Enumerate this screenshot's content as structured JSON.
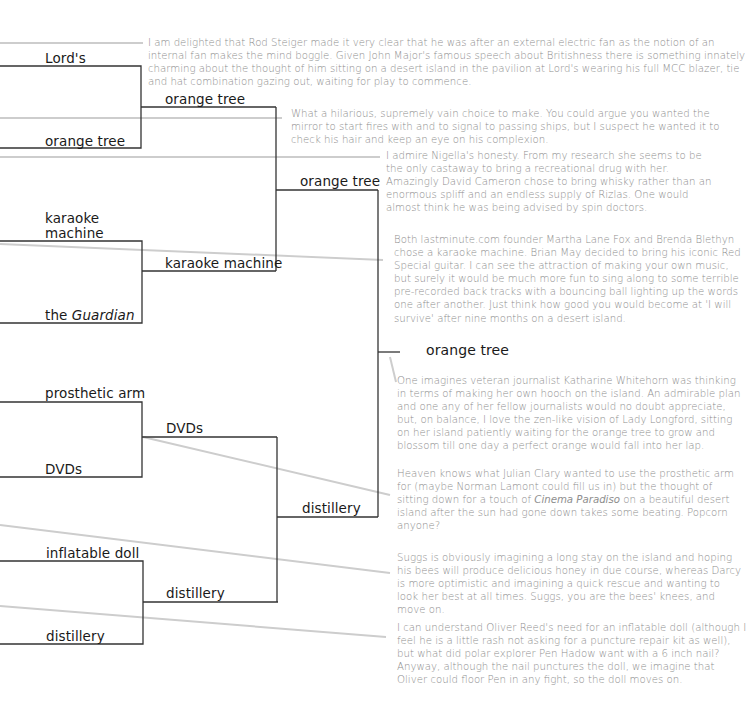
{
  "colors": {
    "bracket_line": "#333333",
    "connector_line": "#cccccc",
    "label_text": "#1a1a1a",
    "comment_text": "#8e8e8e",
    "background": "#ffffff"
  },
  "bracket": {
    "round1": [
      {
        "id": "lords",
        "label": "Lord's"
      },
      {
        "id": "orange-tree",
        "label": "orange tree"
      },
      {
        "id": "karaoke-machine",
        "label_line1": "karaoke",
        "label_line2": "machine"
      },
      {
        "id": "guardian",
        "label_prefix": "the ",
        "label_italic": "Guardian"
      },
      {
        "id": "prosthetic-arm",
        "label": "prosthetic arm"
      },
      {
        "id": "dvds",
        "label": "DVDs"
      },
      {
        "id": "inflatable-doll",
        "label": "inflatable doll"
      },
      {
        "id": "distillery",
        "label": "distillery"
      }
    ],
    "round2": [
      {
        "id": "r2-orange-tree",
        "label": "orange tree"
      },
      {
        "id": "r2-karaoke-machine",
        "label": "karaoke machine"
      },
      {
        "id": "r2-dvds",
        "label": "DVDs"
      },
      {
        "id": "r2-distillery",
        "label": "distillery"
      }
    ],
    "semifinal": [
      {
        "id": "sf-orange-tree",
        "label": "orange tree"
      },
      {
        "id": "sf-distillery",
        "label": "distillery"
      }
    ],
    "winner": {
      "label": "orange tree"
    }
  },
  "comments": [
    {
      "id": "rod-steiger",
      "text": "I am delighted that Rod Steiger made it very clear that he was after an external electric fan as the notion of an internal fan makes the mind boggle. Given John Major's famous speech about Britishness there is something innately charming about the thought of him sitting on a desert island in the pavilion at Lord's wearing his full MCC blazer, tie and hat combination gazing out, waiting for play to commence."
    },
    {
      "id": "vain-choice",
      "text": "What a hilarious, supremely vain choice to make. You could argue you wanted the mirror to start fires with and to signal to passing ships, but I suspect he wanted it to check his hair and keep an eye on his complexion."
    },
    {
      "id": "nigella",
      "text": "I admire Nigella's honesty. From my research she seems to be the only castaway to bring a recreational drug with her. Amazingly David Cameron chose to bring whisky rather than an enormous spliff and an endless supply of Rizlas. One would almost think he was being advised by spin doctors."
    },
    {
      "id": "karaoke",
      "text": "Both lastminute.com founder Martha Lane Fox and Brenda Blethyn chose a karaoke machine. Brian May decided to bring his iconic Red Special guitar. I can see the attraction of making your own music, but surely it would be much more fun to sing along to some terrible pre-recorded back tracks with a bouncing ball lighting up the words one after another. Just think how good you would become at 'I will survive' after nine months on a desert island."
    },
    {
      "id": "whitehorn",
      "text": "One imagines veteran journalist Katharine Whitehorn was thinking in terms of making her own hooch on the island. An admirable plan and one any of her fellow journalists would no doubt appreciate, but, on balance, I love the zen-like vision of Lady Longford, sitting on her island patiently waiting for the orange tree to grow and blossom till one day a perfect orange would fall into her lap."
    },
    {
      "id": "julian-clary",
      "text_before": "Heaven knows what Julian Clary wanted to use the prosthetic arm for (maybe Norman Lamont could fill us in) but the thought of sitting down for a touch of ",
      "text_italic": "Cinema Paradiso",
      "text_after": " on a beautiful desert island after the sun had gone down takes some beating. Popcorn anyone?"
    },
    {
      "id": "suggs",
      "text": "Suggs is obviously imagining a long stay on the island and hoping his bees will produce delicious honey in due course, whereas Darcy is more optimistic and imagining a quick rescue and wanting to look her best at all times. Suggs, you are the bees' knees, and move on."
    },
    {
      "id": "oliver-reed",
      "text": "I can understand Oliver Reed's need for an inflatable doll (although I feel he is a little rash not asking for a puncture repair kit as well), but what did polar explorer Pen Hadow want with a 6 inch nail? Anyway, although the nail punctures the doll, we imagine that Oliver could floor Pen in any fight, so the doll moves on."
    }
  ]
}
